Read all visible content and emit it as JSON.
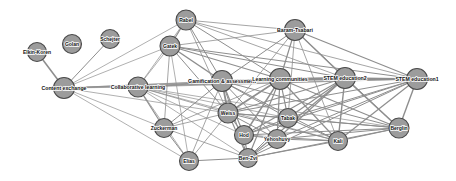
{
  "graph": {
    "title": "Co-authorship / topic network",
    "width": 456,
    "height": 181,
    "background_color": "#ffffff",
    "node_fill_color": "#9c9c9c",
    "node_stroke_color": "#4a4a4a",
    "edge_color": "#8e8e8e",
    "label_color": "#101010",
    "nodes": [
      {
        "id": "elkin-koren",
        "label": "Elkin-Koren",
        "x": 37,
        "y": 52,
        "r": 9.5,
        "font_size": 5.0
      },
      {
        "id": "golan",
        "label": "Golan",
        "x": 72,
        "y": 44,
        "r": 9.5,
        "font_size": 5.0
      },
      {
        "id": "schejter",
        "label": "Schejter",
        "x": 110,
        "y": 39,
        "r": 9.5,
        "font_size": 5.0
      },
      {
        "id": "content-exchange",
        "label": "Content exchange",
        "x": 64,
        "y": 88,
        "r": 10.5,
        "font_size": 5.2
      },
      {
        "id": "collaborative-learning",
        "label": "Collaborative learning",
        "x": 138,
        "y": 87,
        "r": 10.0,
        "font_size": 5.2
      },
      {
        "id": "rabel",
        "label": "Rabel",
        "x": 186,
        "y": 20,
        "r": 10.0,
        "font_size": 5.0
      },
      {
        "id": "gatek",
        "label": "Gatek",
        "x": 170,
        "y": 46,
        "r": 10.0,
        "font_size": 5.0
      },
      {
        "id": "baram-tsabari",
        "label": "Baram-Tsabari",
        "x": 295,
        "y": 30,
        "r": 10.5,
        "font_size": 5.2
      },
      {
        "id": "gamification",
        "label": "Gamification & assessment",
        "x": 222,
        "y": 81,
        "r": 10.5,
        "font_size": 5.2
      },
      {
        "id": "learning-communities",
        "label": "Learning communities",
        "x": 280,
        "y": 79,
        "r": 10.5,
        "font_size": 5.2
      },
      {
        "id": "stem-education2",
        "label": "STEM education2",
        "x": 345,
        "y": 78,
        "r": 10.5,
        "font_size": 5.2
      },
      {
        "id": "stem-education1",
        "label": "STEM education1",
        "x": 417,
        "y": 79,
        "r": 10.5,
        "font_size": 5.2
      },
      {
        "id": "zuckerman",
        "label": "Zuckerman",
        "x": 164,
        "y": 128,
        "r": 9.5,
        "font_size": 5.0
      },
      {
        "id": "weiss",
        "label": "Weiss",
        "x": 228,
        "y": 113,
        "r": 10.0,
        "font_size": 5.0
      },
      {
        "id": "hod",
        "label": "Hod",
        "x": 244,
        "y": 135,
        "r": 9.5,
        "font_size": 5.0
      },
      {
        "id": "tabak",
        "label": "Tabak",
        "x": 288,
        "y": 118,
        "r": 9.5,
        "font_size": 5.0
      },
      {
        "id": "yehoshuvy",
        "label": "Yehoshuvy",
        "x": 277,
        "y": 139,
        "r": 9.5,
        "font_size": 5.0
      },
      {
        "id": "kali",
        "label": "Kali",
        "x": 338,
        "y": 141,
        "r": 9.5,
        "font_size": 5.0
      },
      {
        "id": "berglin",
        "label": "Berglin",
        "x": 399,
        "y": 128,
        "r": 10.0,
        "font_size": 5.0
      },
      {
        "id": "elias",
        "label": "Elias",
        "x": 189,
        "y": 161,
        "r": 9.5,
        "font_size": 5.0
      },
      {
        "id": "ben-zvi",
        "label": "Ben-Zvi",
        "x": 248,
        "y": 158,
        "r": 9.5,
        "font_size": 5.0
      }
    ],
    "edges": [
      {
        "source": "elkin-koren",
        "target": "content-exchange",
        "width": 1.5
      },
      {
        "source": "schejter",
        "target": "content-exchange",
        "width": 1.0
      },
      {
        "source": "content-exchange",
        "target": "collaborative-learning",
        "width": 0.7
      },
      {
        "source": "content-exchange",
        "target": "gatek",
        "width": 0.7
      },
      {
        "source": "content-exchange",
        "target": "rabel",
        "width": 0.7
      },
      {
        "source": "content-exchange",
        "target": "gamification",
        "width": 0.7
      },
      {
        "source": "content-exchange",
        "target": "learning-communities",
        "width": 0.7
      },
      {
        "source": "content-exchange",
        "target": "stem-education2",
        "width": 0.7
      },
      {
        "source": "content-exchange",
        "target": "stem-education1",
        "width": 0.7
      },
      {
        "source": "content-exchange",
        "target": "weiss",
        "width": 0.7
      },
      {
        "source": "content-exchange",
        "target": "zuckerman",
        "width": 0.7
      },
      {
        "source": "content-exchange",
        "target": "elias",
        "width": 0.7
      },
      {
        "source": "collaborative-learning",
        "target": "gatek",
        "width": 0.7
      },
      {
        "source": "collaborative-learning",
        "target": "rabel",
        "width": 0.7
      },
      {
        "source": "collaborative-learning",
        "target": "gamification",
        "width": 0.8
      },
      {
        "source": "collaborative-learning",
        "target": "learning-communities",
        "width": 0.8
      },
      {
        "source": "collaborative-learning",
        "target": "stem-education2",
        "width": 0.7
      },
      {
        "source": "collaborative-learning",
        "target": "stem-education1",
        "width": 0.7
      },
      {
        "source": "collaborative-learning",
        "target": "weiss",
        "width": 0.8
      },
      {
        "source": "collaborative-learning",
        "target": "hod",
        "width": 0.7
      },
      {
        "source": "collaborative-learning",
        "target": "tabak",
        "width": 0.7
      },
      {
        "source": "collaborative-learning",
        "target": "kali",
        "width": 0.7
      },
      {
        "source": "collaborative-learning",
        "target": "berglin",
        "width": 0.7
      },
      {
        "source": "collaborative-learning",
        "target": "zuckerman",
        "width": 1.2
      },
      {
        "source": "collaborative-learning",
        "target": "elias",
        "width": 0.7
      },
      {
        "source": "collaborative-learning",
        "target": "ben-zvi",
        "width": 0.7
      },
      {
        "source": "rabel",
        "target": "gatek",
        "width": 1.2
      },
      {
        "source": "rabel",
        "target": "gamification",
        "width": 1.0
      },
      {
        "source": "rabel",
        "target": "learning-communities",
        "width": 1.0
      },
      {
        "source": "rabel",
        "target": "stem-education2",
        "width": 0.8
      },
      {
        "source": "rabel",
        "target": "stem-education1",
        "width": 0.8
      },
      {
        "source": "rabel",
        "target": "baram-tsabari",
        "width": 0.8
      },
      {
        "source": "rabel",
        "target": "weiss",
        "width": 0.8
      },
      {
        "source": "gatek",
        "target": "gamification",
        "width": 1.5
      },
      {
        "source": "gatek",
        "target": "learning-communities",
        "width": 1.2
      },
      {
        "source": "gatek",
        "target": "stem-education2",
        "width": 1.0
      },
      {
        "source": "gatek",
        "target": "stem-education1",
        "width": 1.0
      },
      {
        "source": "gatek",
        "target": "baram-tsabari",
        "width": 0.8
      },
      {
        "source": "gatek",
        "target": "weiss",
        "width": 1.0
      },
      {
        "source": "gatek",
        "target": "zuckerman",
        "width": 0.8
      },
      {
        "source": "gatek",
        "target": "elias",
        "width": 0.7
      },
      {
        "source": "baram-tsabari",
        "target": "gamification",
        "width": 1.0
      },
      {
        "source": "baram-tsabari",
        "target": "learning-communities",
        "width": 1.2
      },
      {
        "source": "baram-tsabari",
        "target": "stem-education2",
        "width": 1.4
      },
      {
        "source": "baram-tsabari",
        "target": "stem-education1",
        "width": 1.2
      },
      {
        "source": "baram-tsabari",
        "target": "tabak",
        "width": 0.8
      },
      {
        "source": "baram-tsabari",
        "target": "kali",
        "width": 0.8
      },
      {
        "source": "baram-tsabari",
        "target": "berglin",
        "width": 0.8
      },
      {
        "source": "baram-tsabari",
        "target": "weiss",
        "width": 0.8
      },
      {
        "source": "gamification",
        "target": "learning-communities",
        "width": 2.0
      },
      {
        "source": "gamification",
        "target": "stem-education2",
        "width": 1.4
      },
      {
        "source": "gamification",
        "target": "stem-education1",
        "width": 1.2
      },
      {
        "source": "gamification",
        "target": "weiss",
        "width": 1.8
      },
      {
        "source": "gamification",
        "target": "hod",
        "width": 1.2
      },
      {
        "source": "gamification",
        "target": "tabak",
        "width": 1.0
      },
      {
        "source": "gamification",
        "target": "yehoshuvy",
        "width": 1.0
      },
      {
        "source": "gamification",
        "target": "kali",
        "width": 1.0
      },
      {
        "source": "gamification",
        "target": "berglin",
        "width": 1.0
      },
      {
        "source": "gamification",
        "target": "zuckerman",
        "width": 1.0
      },
      {
        "source": "gamification",
        "target": "ben-zvi",
        "width": 1.0
      },
      {
        "source": "gamification",
        "target": "elias",
        "width": 0.8
      },
      {
        "source": "learning-communities",
        "target": "stem-education2",
        "width": 1.8
      },
      {
        "source": "learning-communities",
        "target": "stem-education1",
        "width": 1.4
      },
      {
        "source": "learning-communities",
        "target": "weiss",
        "width": 1.6
      },
      {
        "source": "learning-communities",
        "target": "hod",
        "width": 1.4
      },
      {
        "source": "learning-communities",
        "target": "tabak",
        "width": 1.2
      },
      {
        "source": "learning-communities",
        "target": "yehoshuvy",
        "width": 1.2
      },
      {
        "source": "learning-communities",
        "target": "kali",
        "width": 1.2
      },
      {
        "source": "learning-communities",
        "target": "berglin",
        "width": 1.2
      },
      {
        "source": "learning-communities",
        "target": "ben-zvi",
        "width": 1.2
      },
      {
        "source": "learning-communities",
        "target": "zuckerman",
        "width": 0.8
      },
      {
        "source": "stem-education2",
        "target": "stem-education1",
        "width": 1.6
      },
      {
        "source": "stem-education2",
        "target": "weiss",
        "width": 1.2
      },
      {
        "source": "stem-education2",
        "target": "hod",
        "width": 1.2
      },
      {
        "source": "stem-education2",
        "target": "tabak",
        "width": 1.2
      },
      {
        "source": "stem-education2",
        "target": "yehoshuvy",
        "width": 1.2
      },
      {
        "source": "stem-education2",
        "target": "kali",
        "width": 1.4
      },
      {
        "source": "stem-education2",
        "target": "berglin",
        "width": 1.6
      },
      {
        "source": "stem-education2",
        "target": "ben-zvi",
        "width": 1.2
      },
      {
        "source": "stem-education1",
        "target": "weiss",
        "width": 1.0
      },
      {
        "source": "stem-education1",
        "target": "hod",
        "width": 1.0
      },
      {
        "source": "stem-education1",
        "target": "tabak",
        "width": 1.0
      },
      {
        "source": "stem-education1",
        "target": "yehoshuvy",
        "width": 1.0
      },
      {
        "source": "stem-education1",
        "target": "kali",
        "width": 1.2
      },
      {
        "source": "stem-education1",
        "target": "berglin",
        "width": 1.4
      },
      {
        "source": "stem-education1",
        "target": "ben-zvi",
        "width": 1.0
      },
      {
        "source": "weiss",
        "target": "hod",
        "width": 1.2
      },
      {
        "source": "weiss",
        "target": "tabak",
        "width": 1.0
      },
      {
        "source": "weiss",
        "target": "yehoshuvy",
        "width": 1.0
      },
      {
        "source": "weiss",
        "target": "kali",
        "width": 1.0
      },
      {
        "source": "weiss",
        "target": "berglin",
        "width": 1.0
      },
      {
        "source": "weiss",
        "target": "ben-zvi",
        "width": 1.2
      },
      {
        "source": "weiss",
        "target": "zuckerman",
        "width": 0.8
      },
      {
        "source": "weiss",
        "target": "elias",
        "width": 0.8
      },
      {
        "source": "hod",
        "target": "tabak",
        "width": 1.0
      },
      {
        "source": "hod",
        "target": "yehoshuvy",
        "width": 1.0
      },
      {
        "source": "hod",
        "target": "kali",
        "width": 1.0
      },
      {
        "source": "hod",
        "target": "berglin",
        "width": 1.0
      },
      {
        "source": "hod",
        "target": "ben-zvi",
        "width": 1.2
      },
      {
        "source": "tabak",
        "target": "kali",
        "width": 1.0
      },
      {
        "source": "tabak",
        "target": "berglin",
        "width": 1.0
      },
      {
        "source": "tabak",
        "target": "ben-zvi",
        "width": 1.0
      },
      {
        "source": "yehoshuvy",
        "target": "kali",
        "width": 1.0
      },
      {
        "source": "yehoshuvy",
        "target": "berglin",
        "width": 1.0
      },
      {
        "source": "yehoshuvy",
        "target": "ben-zvi",
        "width": 1.0
      },
      {
        "source": "kali",
        "target": "berglin",
        "width": 1.2
      },
      {
        "source": "kali",
        "target": "ben-zvi",
        "width": 1.0
      },
      {
        "source": "berglin",
        "target": "ben-zvi",
        "width": 1.0
      },
      {
        "source": "zuckerman",
        "target": "elias",
        "width": 1.0
      },
      {
        "source": "zuckerman",
        "target": "ben-zvi",
        "width": 0.8
      },
      {
        "source": "elias",
        "target": "ben-zvi",
        "width": 1.0
      }
    ]
  }
}
